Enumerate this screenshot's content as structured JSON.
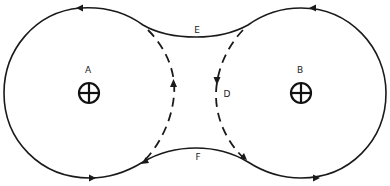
{
  "diagram": {
    "labels": {
      "center_a": "A",
      "center_b": "B",
      "top_path": "E",
      "bottom_path": "F",
      "dashed_arc": "D"
    },
    "line_color": "#1a1a1a",
    "flow_directions": {
      "outer_loop": "counterclockwise",
      "left_dashed_arc": "up",
      "right_dashed_arc": "down"
    }
  }
}
